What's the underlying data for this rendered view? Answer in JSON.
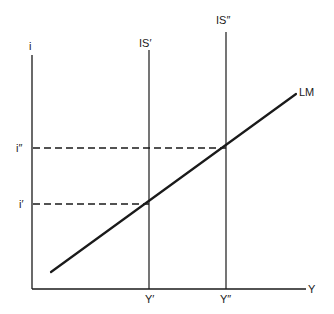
{
  "diagram": {
    "type": "IS-LM diagram",
    "axes": {
      "y_label": "i",
      "x_label": "Y"
    },
    "curves": {
      "is_prime": "IS′",
      "is_double_prime": "IS″",
      "lm": "LM"
    },
    "interest_levels": {
      "i_prime": "i′",
      "i_double_prime": "i″"
    },
    "output_levels": {
      "y_prime": "Y′",
      "y_double_prime": "Y″"
    },
    "colors": {
      "ink": "#1a1a1a",
      "background": "#ffffff"
    }
  }
}
